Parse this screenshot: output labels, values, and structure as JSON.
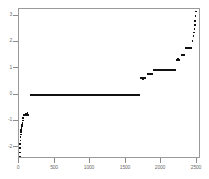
{
  "chart_data": {
    "type": "scatter",
    "title": "",
    "subtitle": "",
    "xlabel": "",
    "ylabel": "",
    "xlim": [
      0,
      2560
    ],
    "ylim": [
      -2.45,
      3.25
    ],
    "grid": false,
    "legend": null,
    "xticks": [
      0,
      500,
      1000,
      1500,
      2000,
      2500
    ],
    "xticklabels": [
      "0",
      "500",
      "1000",
      "1500",
      "2000",
      "2500"
    ],
    "yticks": [
      -2,
      -1,
      0,
      1,
      2,
      3
    ],
    "yticklabels": [
      "-2",
      "-1",
      "0",
      "1",
      "2",
      "3"
    ],
    "marker": "square",
    "marker_color": "#111111",
    "segments": [
      {
        "x0": 150,
        "x1": 1700,
        "y": 0.0
      },
      {
        "x0": 1700,
        "x1": 1790,
        "y": 0.62
      },
      {
        "x0": 1800,
        "x1": 1880,
        "y": 0.78
      },
      {
        "x0": 1880,
        "x1": 2215,
        "y": 0.95
      },
      {
        "x0": 2215,
        "x1": 2270,
        "y": 1.32
      },
      {
        "x0": 2275,
        "x1": 2330,
        "y": 1.5
      },
      {
        "x0": 2335,
        "x1": 2430,
        "y": 1.78
      },
      {
        "x0": 2432,
        "x1": 2452,
        "y": 2.02
      },
      {
        "x0": 60,
        "x1": 145,
        "y": -0.78
      },
      {
        "x0": 44,
        "x1": 62,
        "y": -1.08
      },
      {
        "x0": 30,
        "x1": 44,
        "y": -1.28
      }
    ],
    "points": [
      {
        "x": 10,
        "y": -2.36
      },
      {
        "x": 14,
        "y": -2.2
      },
      {
        "x": 16,
        "y": -2.02
      },
      {
        "x": 18,
        "y": -1.88
      },
      {
        "x": 20,
        "y": -1.74
      },
      {
        "x": 22,
        "y": -1.62
      },
      {
        "x": 24,
        "y": -1.52
      },
      {
        "x": 27,
        "y": -1.42
      },
      {
        "x": 30,
        "y": -1.34
      },
      {
        "x": 34,
        "y": -1.26
      },
      {
        "x": 38,
        "y": -1.2
      },
      {
        "x": 42,
        "y": -1.14
      },
      {
        "x": 48,
        "y": -1.06
      },
      {
        "x": 54,
        "y": -0.98
      },
      {
        "x": 60,
        "y": -0.9
      },
      {
        "x": 96,
        "y": -0.72
      },
      {
        "x": 120,
        "y": -0.7
      },
      {
        "x": 1745,
        "y": 0.6
      },
      {
        "x": 1830,
        "y": 0.76
      },
      {
        "x": 2240,
        "y": 1.34
      },
      {
        "x": 2300,
        "y": 1.52
      },
      {
        "x": 2440,
        "y": 2.05
      },
      {
        "x": 2452,
        "y": 2.22
      },
      {
        "x": 2460,
        "y": 2.36
      },
      {
        "x": 2466,
        "y": 2.5
      },
      {
        "x": 2472,
        "y": 2.64
      },
      {
        "x": 2478,
        "y": 2.8
      },
      {
        "x": 2484,
        "y": 2.98
      },
      {
        "x": 2490,
        "y": 3.16
      }
    ]
  }
}
